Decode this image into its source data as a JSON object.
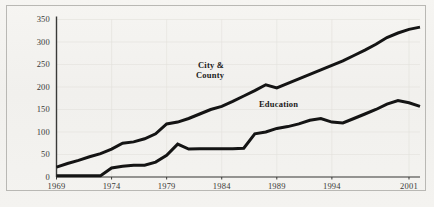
{
  "chart_data": {
    "type": "line",
    "title": "",
    "subtitle": "",
    "xlabel": "",
    "ylabel": "",
    "xlim": [
      1969,
      2002
    ],
    "ylim": [
      0,
      350
    ],
    "grid": true,
    "legend_position": "inline-annotations",
    "y_ticks": [
      0,
      50,
      100,
      150,
      200,
      250,
      300,
      350
    ],
    "y_tick_labels": [
      "0",
      "50",
      "100",
      "150",
      "200",
      "250",
      "300",
      "350"
    ],
    "x_ticks": [
      1969,
      1974,
      1979,
      1984,
      1989,
      1994,
      2001
    ],
    "x_tick_labels": [
      "1969",
      "1974",
      "1979",
      "1984",
      "1989",
      "1994",
      "2001"
    ],
    "x": [
      1969,
      1970,
      1971,
      1972,
      1973,
      1974,
      1975,
      1976,
      1977,
      1978,
      1979,
      1980,
      1981,
      1982,
      1983,
      1984,
      1985,
      1986,
      1987,
      1988,
      1989,
      1990,
      1991,
      1992,
      1993,
      1994,
      1995,
      1996,
      1997,
      1998,
      1999,
      2000,
      2001,
      2002
    ],
    "series": [
      {
        "name": "City & County",
        "color": "#141414",
        "label_text": "City &\nCounty",
        "values": [
          22,
          30,
          37,
          45,
          52,
          62,
          75,
          78,
          85,
          96,
          118,
          122,
          130,
          140,
          150,
          157,
          168,
          180,
          192,
          205,
          198,
          208,
          218,
          228,
          238,
          248,
          258,
          270,
          282,
          295,
          310,
          320,
          328,
          333
        ]
      },
      {
        "name": "Education",
        "color": "#141414",
        "label_text": "Education",
        "values": [
          3,
          3,
          3,
          3,
          3,
          20,
          24,
          26,
          26,
          33,
          48,
          73,
          62,
          63,
          63,
          63,
          63,
          64,
          96,
          100,
          108,
          112,
          118,
          126,
          130,
          122,
          120,
          130,
          140,
          150,
          162,
          170,
          165,
          157
        ]
      }
    ],
    "annotations": [
      {
        "text": "City &",
        "x_px": 198,
        "y_px": 60
      },
      {
        "text": "County",
        "x_px": 196,
        "y_px": 70
      },
      {
        "text": "Education",
        "x_px": 259,
        "y_px": 99
      }
    ]
  },
  "figure": {
    "background_color": "#f4f3f0",
    "frame_color": "#b9b8b4",
    "axis_color": "#3a3a38",
    "grid_color": "#e2e0dc",
    "line_color": "#141414"
  }
}
